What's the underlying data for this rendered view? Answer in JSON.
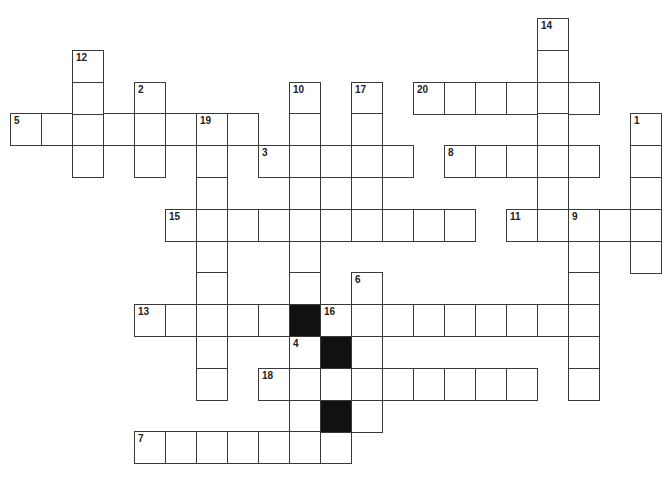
{
  "puzzle": {
    "grid": {
      "origin_x": 10,
      "origin_y": 18,
      "cell_w": 31,
      "cell_h": 31.8
    },
    "colors": {
      "cell_border": "#3a3a3a",
      "cell_fill": "#ffffff",
      "block_fill": "#111111",
      "number_text": "#222222"
    },
    "entries": [
      {
        "number": "1",
        "direction": "down",
        "col": 20,
        "row": 3,
        "length": 5
      },
      {
        "number": "2",
        "direction": "down",
        "col": 4,
        "row": 2,
        "length": 3
      },
      {
        "number": "3",
        "direction": "across",
        "col": 8,
        "row": 4,
        "length": 5
      },
      {
        "number": "4",
        "direction": "down",
        "col": 9,
        "row": 10,
        "length": 4
      },
      {
        "number": "5",
        "direction": "across",
        "col": 0,
        "row": 3,
        "length": 8
      },
      {
        "number": "6",
        "direction": "down",
        "col": 11,
        "row": 8,
        "length": 5
      },
      {
        "number": "7",
        "direction": "across",
        "col": 4,
        "row": 13,
        "length": 7
      },
      {
        "number": "8",
        "direction": "across",
        "col": 14,
        "row": 4,
        "length": 5
      },
      {
        "number": "9",
        "direction": "down",
        "col": 18,
        "row": 6,
        "length": 6
      },
      {
        "number": "10",
        "direction": "down",
        "col": 9,
        "row": 2,
        "length": 7
      },
      {
        "number": "11",
        "direction": "across",
        "col": 16,
        "row": 6,
        "length": 5
      },
      {
        "number": "12",
        "direction": "down",
        "col": 2,
        "row": 1,
        "length": 4
      },
      {
        "number": "13",
        "direction": "across",
        "col": 4,
        "row": 9,
        "length": 5
      },
      {
        "number": "14",
        "direction": "down",
        "col": 17,
        "row": 0,
        "length": 7
      },
      {
        "number": "15",
        "direction": "across",
        "col": 5,
        "row": 6,
        "length": 10
      },
      {
        "number": "16",
        "direction": "across",
        "col": 10,
        "row": 9,
        "length": 9
      },
      {
        "number": "17",
        "direction": "down",
        "col": 11,
        "row": 2,
        "length": 5
      },
      {
        "number": "18",
        "direction": "across",
        "col": 8,
        "row": 11,
        "length": 9
      },
      {
        "number": "19",
        "direction": "down",
        "col": 6,
        "row": 3,
        "length": 9
      },
      {
        "number": "20",
        "direction": "across",
        "col": 13,
        "row": 2,
        "length": 6
      }
    ],
    "blocks": [
      {
        "col": 9,
        "row": 9
      },
      {
        "col": 10,
        "row": 10
      },
      {
        "col": 10,
        "row": 12
      }
    ]
  }
}
